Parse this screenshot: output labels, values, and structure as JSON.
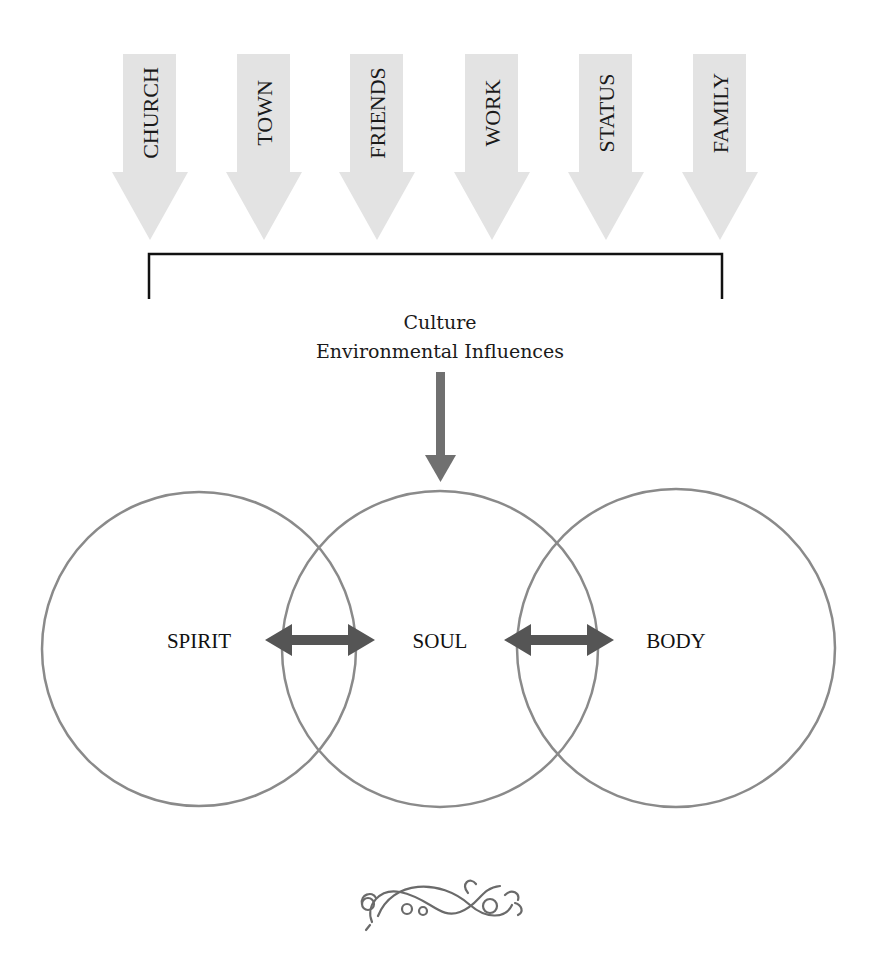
{
  "influences": [
    {
      "label": "CHURCH",
      "x": 150
    },
    {
      "label": "TOWN",
      "x": 264
    },
    {
      "label": "FRIENDS",
      "x": 377
    },
    {
      "label": "WORK",
      "x": 492
    },
    {
      "label": "STATUS",
      "x": 606
    },
    {
      "label": "FAMILY",
      "x": 720
    }
  ],
  "caption": {
    "line1": "Culture",
    "line2": "Environmental Influences"
  },
  "circles": [
    {
      "label": "SPIRIT",
      "cx": 199,
      "cy": 649,
      "r": 157
    },
    {
      "label": "SOUL",
      "cx": 440,
      "cy": 649,
      "r": 158
    },
    {
      "label": "BODY",
      "cx": 676,
      "cy": 648,
      "r": 159
    }
  ],
  "colors": {
    "influence_arrow": "#e3e3e3",
    "circle_stroke": "#8a8a8a",
    "connector": "#555555",
    "bracket": "#111111",
    "text": "#111111"
  },
  "ornament": "decorative-flourish"
}
